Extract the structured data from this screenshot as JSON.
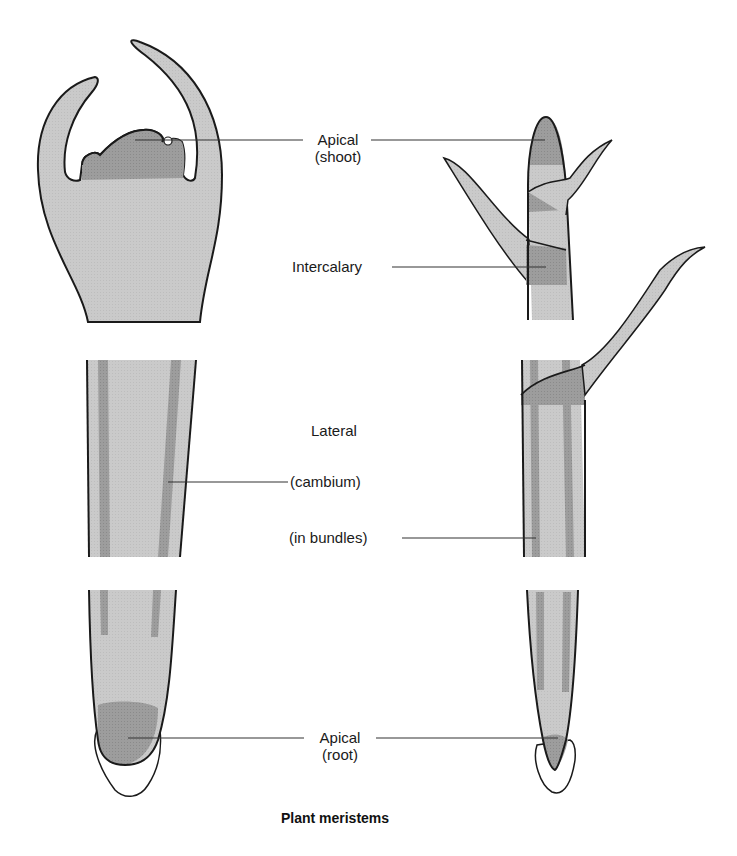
{
  "figure": {
    "caption": "Plant meristems",
    "colors": {
      "tissue_light": "#c9c9c9",
      "meristem_dark": "#9a9a9a",
      "outline": "#1a1a1a",
      "leader_line": "#333333",
      "background": "#ffffff"
    },
    "labels": {
      "apical_shoot": {
        "line1": "Apical",
        "line2": "(shoot)"
      },
      "intercalary": "Intercalary",
      "lateral": "Lateral",
      "cambium": "(cambium)",
      "in_bundles": "(in bundles)",
      "apical_root": {
        "line1": "Apical",
        "line2": "(root)"
      }
    },
    "panels": {
      "left": "dicot-style shoot apex, stem with cambium, root tip",
      "right": "monocot-style shoot with leaves, stem with bundles, root tip"
    }
  }
}
